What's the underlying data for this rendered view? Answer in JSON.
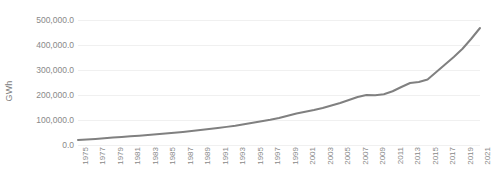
{
  "chart_data": {
    "type": "line",
    "title": "",
    "xlabel": "",
    "ylabel": "GWh",
    "ylim": [
      0,
      500000
    ],
    "xlim": [
      1975,
      2021
    ],
    "grid": true,
    "grid_axis": "y",
    "legend": false,
    "legend_position": "none",
    "line_color": "#808080",
    "grid_color": "#f0f0f0",
    "background_color": "#ffffff",
    "tick_label_color": "#898989",
    "y_ticks": [
      "0.0",
      "100,000.0",
      "200,000.0",
      "300,000.0",
      "400,000.0",
      "500,000.0"
    ],
    "y_tick_values": [
      0,
      100000,
      200000,
      300000,
      400000,
      500000
    ],
    "x_tick_labels": [
      "1975",
      "1977",
      "1979",
      "1981",
      "1983",
      "1985",
      "1987",
      "1989",
      "1991",
      "1993",
      "1995",
      "1997",
      "1999",
      "2001",
      "2003",
      "2005",
      "2007",
      "2009",
      "2011",
      "2013",
      "2015",
      "2017",
      "2019",
      "2021"
    ],
    "x": [
      1975,
      1976,
      1977,
      1978,
      1979,
      1980,
      1981,
      1982,
      1983,
      1984,
      1985,
      1986,
      1987,
      1988,
      1989,
      1990,
      1991,
      1992,
      1993,
      1994,
      1995,
      1996,
      1997,
      1998,
      1999,
      2000,
      2001,
      2002,
      2003,
      2004,
      2005,
      2006,
      2007,
      2008,
      2009,
      2010,
      2011,
      2012,
      2013,
      2014,
      2015,
      2016,
      2017,
      2018,
      2019,
      2020,
      2021
    ],
    "series": [
      {
        "name": "GWh",
        "values": [
          20000,
          22000,
          24500,
          27000,
          30000,
          32500,
          35000,
          37500,
          40000,
          43000,
          46000,
          49000,
          52500,
          56000,
          60000,
          64000,
          68000,
          72500,
          77000,
          83000,
          89000,
          95000,
          101000,
          108000,
          117000,
          126000,
          133000,
          140000,
          148000,
          158000,
          168000,
          180000,
          192000,
          200000,
          199000,
          203000,
          215000,
          232000,
          248000,
          252000,
          262000,
          292000,
          322000,
          352000,
          385000,
          425000,
          468000
        ]
      }
    ]
  }
}
